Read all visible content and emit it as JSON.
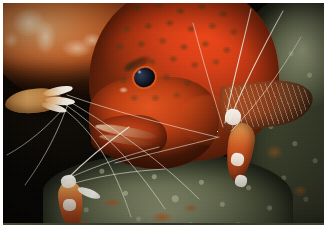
{
  "image": {
    "kind": "photograph",
    "medium": "underwater-reef-photo",
    "orientation": "landscape",
    "width_px": 327,
    "height_px": 228,
    "border": {
      "style": "white-photo-border",
      "color": "#ffffff",
      "thickness_px": 3
    }
  },
  "scene": {
    "title": "Red grouper at a cleaning station",
    "setting": "Shaded coral reef ledge / overhang",
    "lighting": "Direct strobe flash from upper left against dark water",
    "background_color": "#0a0906"
  },
  "subjects": {
    "fish": {
      "name": "Coral hind grouper",
      "label": "grouper",
      "position": "center, facing lower-left",
      "body_color": "#d83f16",
      "highlight_color": "#f0471a",
      "shadow_color": "#7a2a0e",
      "spot_color": "#463c16",
      "spot_pattern": "dense dark olive polygonal spots over red-orange",
      "eye": {
        "label": "grouper-eye",
        "iris_color": "#1b2436",
        "ring_color": "#e2601c",
        "glint_color": "#c8d7f0"
      },
      "fin": {
        "label": "pectoral fin",
        "color": "#b25426",
        "ray_color": "#eed6bc"
      },
      "mouth": {
        "label": "jaw line",
        "color": "#ebd2b4"
      }
    },
    "shrimp": [
      {
        "id": "shrimp-left",
        "label": "Cleaner shrimp (left)",
        "position": "left edge, mid-height",
        "body_color": "#e2a860",
        "band_color": "#fcfaf6",
        "feature": "white-tipped pincer claws extended toward the fish"
      },
      {
        "id": "shrimp-right",
        "label": "Cleaner shrimp (right)",
        "position": "right of center, below the pectoral fin",
        "body_color": "#d45c24",
        "band_color": "#fcfaf6",
        "feature": "white banded carapace and long white antennae"
      },
      {
        "id": "shrimp-bottom",
        "label": "Cleaner shrimp (lower left)",
        "position": "bottom left on the rock",
        "body_color": "#d06026",
        "band_color": "#fcfaf6",
        "feature": "white banded body with raised antennae"
      }
    ],
    "antennae": {
      "label": "Shrimp antennae",
      "color": "#f3efe4",
      "description": "Long pale antennae sweeping across the dark water in crossing arcs",
      "count": 14
    }
  },
  "environment": [
    {
      "id": "coral-overhang",
      "label": "Coral overhang",
      "position": "top left",
      "color": "#d2763a",
      "highlight_color": "#fff0d7"
    },
    {
      "id": "rock-right",
      "label": "Encrusted reef rock",
      "position": "right side",
      "color": "#6b7154",
      "accent_color": "#b45c1c"
    },
    {
      "id": "rock-bottom",
      "label": "Algae covered rock",
      "position": "bottom",
      "color": "#7e8566",
      "accent_color": "#ba5418"
    },
    {
      "id": "water-background",
      "label": "Dark open water",
      "position": "left of center and upper right",
      "color": "#0a0906"
    }
  ],
  "antennae_paths": [
    {
      "d": "M 62 96 C 100 118 150 150 196 196",
      "weight": "thin"
    },
    {
      "d": "M 60 100 C 96 124 130 158 162 206",
      "weight": "thin"
    },
    {
      "d": "M 64 92 C 110 108 164 122 214 134",
      "weight": "thin"
    },
    {
      "d": "M 58 104 C 92 128 112 166 128 214",
      "weight": "thin"
    },
    {
      "d": "M 66 98 C 56 126 44 152 22 182",
      "weight": "thin"
    },
    {
      "d": "M 60 106 C 44 124 26 140 4 152",
      "weight": "thin"
    },
    {
      "d": "M 222 120 C 228 86 238 50 248 6",
      "weight": "med"
    },
    {
      "d": "M 226 118 C 240 84 258 48 280 8",
      "weight": "med"
    },
    {
      "d": "M 220 124 C 210 92 200 58 190 20",
      "weight": "thin"
    },
    {
      "d": "M 228 128 C 252 104 276 72 298 34",
      "weight": "thin"
    },
    {
      "d": "M 216 134 C 186 142 150 150 112 160",
      "weight": "thin"
    },
    {
      "d": "M 64 176 C 84 156 104 140 126 124",
      "weight": "med"
    },
    {
      "d": "M 68 174 C 96 162 124 152 156 144",
      "weight": "thin"
    },
    {
      "d": "M 72 180 C 100 172 130 168 162 166",
      "weight": "thin"
    }
  ]
}
